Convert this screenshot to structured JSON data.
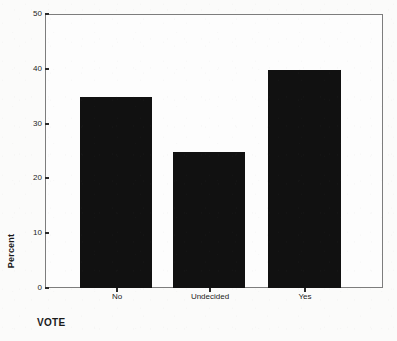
{
  "chart_data": {
    "type": "bar",
    "title": "",
    "subtitle": "",
    "categories": [
      "No",
      "Undecided",
      "Yes"
    ],
    "values": [
      35,
      25,
      40
    ],
    "series": [
      {
        "name": "Percent",
        "values": [
          35,
          25,
          40
        ]
      }
    ],
    "xlabel": "VOTE",
    "ylabel": "Percent",
    "ylim": [
      0,
      50
    ],
    "yticks": [
      0,
      10,
      20,
      30,
      40,
      50
    ],
    "ytick_labels": [
      "0",
      "10",
      "20",
      "30",
      "40",
      "50"
    ],
    "grid": false,
    "legend": false,
    "legend_position": "none",
    "bar_color": "#111111",
    "frame_color": "#7d7d7d",
    "background_color": "#fbfbfa",
    "text_color": "#1c1c1c",
    "annotations": []
  },
  "axis": {
    "y_title": "Percent",
    "x_title": "VOTE"
  }
}
